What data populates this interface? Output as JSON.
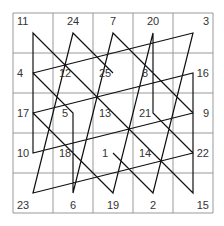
{
  "grid": {
    "rows": 5,
    "cols": 5,
    "cells": [
      [
        "11",
        "24",
        "7",
        "20",
        "3"
      ],
      [
        "4",
        "12",
        "25",
        "8",
        "16"
      ],
      [
        "17",
        "5",
        "13",
        "21",
        "9"
      ],
      [
        "10",
        "18",
        "1",
        "14",
        "22"
      ],
      [
        "23",
        "6",
        "19",
        "2",
        "15"
      ]
    ]
  },
  "colors": {
    "line": "#111111",
    "grid": "#999999",
    "text": "#333333"
  }
}
